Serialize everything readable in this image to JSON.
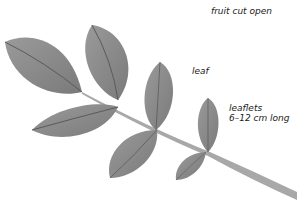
{
  "labels": {
    "fruit": "fruit cut open",
    "leaf": "leaf",
    "leaflets_line1": "leaflets",
    "leaflets_line2": "6–12 cm long"
  },
  "colors": {
    "background": "#ffffff",
    "leaflet_fill": "#8c8c8c",
    "leaflet_dark": "#6e6e6e",
    "vein": "#5a5a5a",
    "rachis": "#a8a8a8",
    "text": "#1a1a1a"
  }
}
